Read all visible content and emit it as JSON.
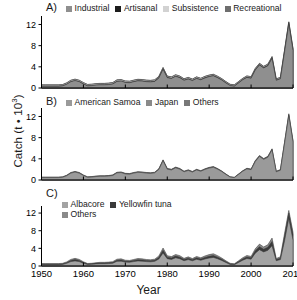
{
  "figure": {
    "xlabel": "Year",
    "ylabel_text": "Catch (t • 10",
    "ylabel_exp": "3",
    "ylabel_close": ")",
    "background": "#ffffff",
    "axis_color": "#000000"
  },
  "axes": {
    "xticks": [
      1950,
      1960,
      1970,
      1980,
      1990,
      2000,
      2010
    ],
    "yticks": [
      0,
      4,
      8,
      12
    ],
    "xlim": [
      1950,
      2010
    ],
    "ylim": [
      0,
      13.6
    ]
  },
  "panels": [
    {
      "tag": "A)",
      "legend_rows": [
        [
          "Industrial",
          "Artisanal",
          "Subsistence",
          "Recreational"
        ]
      ]
    },
    {
      "tag": "B)",
      "legend_rows": [
        [
          "American Samoa",
          "Japan",
          "Others"
        ]
      ]
    },
    {
      "tag": "C)",
      "legend_rows": [
        [
          "Albacore",
          "Yellowfin tuna"
        ],
        [
          "Others"
        ]
      ]
    }
  ],
  "colors": {
    "Industrial": "#8f8f8f",
    "Artisanal": "#1c1c1c",
    "Subsistence": "#d2d2d2",
    "Recreational": "#6e6e6e",
    "American Samoa": "#9a9a9a",
    "Japan": "#8a8a8a",
    "Others": "#787878",
    "Albacore": "#a3a3a3",
    "Yellowfin tuna": "#3a3a3a",
    "Others_C": "#8a8a8a"
  },
  "chart_data": [
    {
      "type": "area",
      "panel": "A",
      "title": "A) Catch by sector",
      "xlabel": "Year",
      "ylabel": "Catch (t • 10^3)",
      "xlim": [
        1950,
        2010
      ],
      "ylim": [
        0,
        13.6
      ],
      "grid": false,
      "legend_position": "top",
      "stacked": true,
      "x": [
        1950,
        1951,
        1952,
        1953,
        1954,
        1955,
        1956,
        1957,
        1958,
        1959,
        1960,
        1961,
        1962,
        1963,
        1964,
        1965,
        1966,
        1967,
        1968,
        1969,
        1970,
        1971,
        1972,
        1973,
        1974,
        1975,
        1976,
        1977,
        1978,
        1979,
        1980,
        1981,
        1982,
        1983,
        1984,
        1985,
        1986,
        1987,
        1988,
        1989,
        1990,
        1991,
        1992,
        1993,
        1994,
        1995,
        1996,
        1997,
        1998,
        1999,
        2000,
        2001,
        2002,
        2003,
        2004,
        2005,
        2006,
        2007,
        2008,
        2009,
        2010
      ],
      "series": [
        {
          "name": "Industrial",
          "values": [
            0.35,
            0.35,
            0.35,
            0.35,
            0.35,
            0.4,
            0.7,
            1.2,
            1.4,
            1.2,
            0.75,
            0.4,
            0.45,
            0.55,
            0.6,
            0.6,
            0.65,
            0.75,
            1.25,
            1.3,
            1.05,
            1.0,
            1.2,
            1.35,
            1.3,
            1.2,
            1.15,
            1.25,
            1.9,
            3.55,
            1.95,
            1.8,
            2.2,
            1.95,
            1.45,
            1.7,
            1.4,
            1.8,
            1.55,
            1.9,
            2.15,
            2.3,
            1.95,
            1.5,
            0.95,
            0.45,
            0.35,
            0.95,
            1.55,
            2.0,
            1.85,
            3.4,
            4.35,
            3.8,
            4.2,
            5.6,
            1.45,
            1.75,
            6.9,
            12.1,
            7.1
          ]
        },
        {
          "name": "Artisanal",
          "values": [
            0.02,
            0.02,
            0.02,
            0.02,
            0.02,
            0.02,
            0.03,
            0.03,
            0.03,
            0.03,
            0.03,
            0.03,
            0.03,
            0.03,
            0.03,
            0.03,
            0.03,
            0.04,
            0.04,
            0.04,
            0.04,
            0.04,
            0.04,
            0.05,
            0.05,
            0.05,
            0.05,
            0.05,
            0.06,
            0.08,
            0.06,
            0.06,
            0.07,
            0.06,
            0.05,
            0.06,
            0.05,
            0.06,
            0.05,
            0.06,
            0.07,
            0.07,
            0.06,
            0.05,
            0.04,
            0.03,
            0.03,
            0.04,
            0.05,
            0.06,
            0.06,
            0.08,
            0.09,
            0.08,
            0.09,
            0.11,
            0.05,
            0.06,
            0.12,
            0.18,
            0.13
          ]
        },
        {
          "name": "Subsistence",
          "values": [
            0.2,
            0.2,
            0.2,
            0.2,
            0.2,
            0.2,
            0.22,
            0.22,
            0.22,
            0.22,
            0.22,
            0.22,
            0.22,
            0.22,
            0.22,
            0.22,
            0.22,
            0.22,
            0.22,
            0.22,
            0.22,
            0.22,
            0.22,
            0.22,
            0.22,
            0.22,
            0.22,
            0.22,
            0.22,
            0.22,
            0.22,
            0.22,
            0.22,
            0.22,
            0.22,
            0.22,
            0.22,
            0.22,
            0.22,
            0.22,
            0.2,
            0.2,
            0.2,
            0.2,
            0.2,
            0.2,
            0.2,
            0.2,
            0.2,
            0.2,
            0.2,
            0.2,
            0.2,
            0.2,
            0.2,
            0.2,
            0.2,
            0.2,
            0.2,
            0.2,
            0.2
          ]
        },
        {
          "name": "Recreational",
          "values": [
            0.03,
            0.03,
            0.03,
            0.03,
            0.03,
            0.03,
            0.03,
            0.03,
            0.03,
            0.03,
            0.03,
            0.03,
            0.03,
            0.03,
            0.03,
            0.03,
            0.03,
            0.03,
            0.03,
            0.03,
            0.03,
            0.03,
            0.03,
            0.03,
            0.03,
            0.03,
            0.03,
            0.03,
            0.03,
            0.03,
            0.03,
            0.03,
            0.03,
            0.03,
            0.03,
            0.03,
            0.03,
            0.03,
            0.03,
            0.03,
            0.03,
            0.03,
            0.03,
            0.03,
            0.03,
            0.03,
            0.03,
            0.03,
            0.03,
            0.03,
            0.03,
            0.03,
            0.03,
            0.03,
            0.03,
            0.03,
            0.03,
            0.03,
            0.03,
            0.03,
            0.03
          ]
        }
      ]
    },
    {
      "type": "area",
      "panel": "B",
      "title": "B) Catch by fishing country",
      "xlabel": "Year",
      "ylabel": "Catch (t • 10^3)",
      "xlim": [
        1950,
        2010
      ],
      "ylim": [
        0,
        13.6
      ],
      "grid": false,
      "legend_position": "top",
      "stacked": true,
      "x": [
        1950,
        1951,
        1952,
        1953,
        1954,
        1955,
        1956,
        1957,
        1958,
        1959,
        1960,
        1961,
        1962,
        1963,
        1964,
        1965,
        1966,
        1967,
        1968,
        1969,
        1970,
        1971,
        1972,
        1973,
        1974,
        1975,
        1976,
        1977,
        1978,
        1979,
        1980,
        1981,
        1982,
        1983,
        1984,
        1985,
        1986,
        1987,
        1988,
        1989,
        1990,
        1991,
        1992,
        1993,
        1994,
        1995,
        1996,
        1997,
        1998,
        1999,
        2000,
        2001,
        2002,
        2003,
        2004,
        2005,
        2006,
        2007,
        2008,
        2009,
        2010
      ],
      "series": [
        {
          "name": "American Samoa",
          "values": [
            0.45,
            0.45,
            0.45,
            0.45,
            0.45,
            0.5,
            0.8,
            1.3,
            1.5,
            1.3,
            0.85,
            0.5,
            0.55,
            0.65,
            0.7,
            0.7,
            0.75,
            0.85,
            1.35,
            1.4,
            1.15,
            1.1,
            1.3,
            1.45,
            1.4,
            1.3,
            1.25,
            1.35,
            2.0,
            3.65,
            2.05,
            1.9,
            2.3,
            2.05,
            1.55,
            1.8,
            1.5,
            1.9,
            1.65,
            2.0,
            2.25,
            2.4,
            2.05,
            1.6,
            1.05,
            0.55,
            0.45,
            1.05,
            1.65,
            2.1,
            1.95,
            3.5,
            4.45,
            3.9,
            4.3,
            5.7,
            1.55,
            1.85,
            7.0,
            12.2,
            7.2
          ]
        },
        {
          "name": "Japan",
          "values": [
            0.05,
            0.05,
            0.05,
            0.05,
            0.05,
            0.05,
            0.05,
            0.06,
            0.06,
            0.06,
            0.05,
            0.05,
            0.05,
            0.05,
            0.05,
            0.05,
            0.05,
            0.06,
            0.06,
            0.06,
            0.06,
            0.06,
            0.06,
            0.06,
            0.06,
            0.06,
            0.06,
            0.06,
            0.07,
            0.08,
            0.07,
            0.07,
            0.07,
            0.07,
            0.06,
            0.06,
            0.06,
            0.06,
            0.06,
            0.06,
            0.07,
            0.07,
            0.06,
            0.05,
            0.04,
            0.03,
            0.03,
            0.04,
            0.05,
            0.06,
            0.06,
            0.08,
            0.09,
            0.08,
            0.09,
            0.1,
            0.05,
            0.06,
            0.11,
            0.16,
            0.12
          ]
        },
        {
          "name": "Others",
          "values": [
            0.05,
            0.05,
            0.05,
            0.05,
            0.05,
            0.05,
            0.05,
            0.06,
            0.06,
            0.06,
            0.05,
            0.05,
            0.05,
            0.05,
            0.05,
            0.05,
            0.05,
            0.06,
            0.06,
            0.06,
            0.06,
            0.06,
            0.06,
            0.06,
            0.06,
            0.06,
            0.06,
            0.06,
            0.07,
            0.08,
            0.07,
            0.07,
            0.07,
            0.07,
            0.06,
            0.06,
            0.06,
            0.06,
            0.06,
            0.06,
            0.07,
            0.07,
            0.06,
            0.05,
            0.04,
            0.03,
            0.03,
            0.04,
            0.05,
            0.06,
            0.06,
            0.08,
            0.09,
            0.08,
            0.09,
            0.1,
            0.05,
            0.06,
            0.11,
            0.16,
            0.12
          ]
        }
      ]
    },
    {
      "type": "area",
      "panel": "C",
      "title": "C) Catch by taxon",
      "xlabel": "Year",
      "ylabel": "Catch (t • 10^3)",
      "xlim": [
        1950,
        2010
      ],
      "ylim": [
        0,
        13.6
      ],
      "grid": false,
      "legend_position": "top",
      "stacked": true,
      "x": [
        1950,
        1951,
        1952,
        1953,
        1954,
        1955,
        1956,
        1957,
        1958,
        1959,
        1960,
        1961,
        1962,
        1963,
        1964,
        1965,
        1966,
        1967,
        1968,
        1969,
        1970,
        1971,
        1972,
        1973,
        1974,
        1975,
        1976,
        1977,
        1978,
        1979,
        1980,
        1981,
        1982,
        1983,
        1984,
        1985,
        1986,
        1987,
        1988,
        1989,
        1990,
        1991,
        1992,
        1993,
        1994,
        1995,
        1996,
        1997,
        1998,
        1999,
        2000,
        2001,
        2002,
        2003,
        2004,
        2005,
        2006,
        2007,
        2008,
        2009,
        2010
      ],
      "series": [
        {
          "name": "Albacore",
          "values": [
            0.3,
            0.3,
            0.3,
            0.3,
            0.3,
            0.35,
            0.6,
            1.0,
            1.15,
            1.0,
            0.6,
            0.35,
            0.38,
            0.48,
            0.52,
            0.52,
            0.55,
            0.62,
            1.05,
            1.1,
            0.88,
            0.85,
            1.0,
            1.15,
            1.1,
            1.0,
            0.95,
            1.05,
            1.6,
            2.95,
            1.65,
            1.5,
            1.85,
            1.65,
            1.2,
            1.45,
            1.18,
            1.52,
            1.3,
            1.6,
            1.8,
            1.95,
            1.65,
            1.25,
            0.8,
            0.35,
            0.28,
            0.8,
            1.3,
            1.7,
            1.55,
            2.9,
            3.7,
            3.2,
            3.55,
            4.6,
            1.2,
            1.45,
            5.8,
            10.8,
            5.9
          ]
        },
        {
          "name": "Yellowfin tuna",
          "values": [
            0.1,
            0.1,
            0.1,
            0.1,
            0.1,
            0.1,
            0.15,
            0.25,
            0.3,
            0.25,
            0.18,
            0.1,
            0.11,
            0.13,
            0.15,
            0.15,
            0.16,
            0.18,
            0.25,
            0.26,
            0.21,
            0.2,
            0.24,
            0.28,
            0.26,
            0.24,
            0.23,
            0.25,
            0.35,
            0.6,
            0.36,
            0.33,
            0.4,
            0.36,
            0.27,
            0.32,
            0.26,
            0.33,
            0.29,
            0.35,
            0.4,
            0.42,
            0.36,
            0.28,
            0.18,
            0.12,
            0.1,
            0.18,
            0.28,
            0.35,
            0.32,
            0.55,
            0.68,
            0.6,
            0.68,
            0.95,
            0.25,
            0.32,
            1.05,
            1.2,
            1.15
          ]
        },
        {
          "name": "Others",
          "values": [
            0.15,
            0.15,
            0.15,
            0.15,
            0.15,
            0.15,
            0.18,
            0.25,
            0.28,
            0.25,
            0.17,
            0.12,
            0.13,
            0.14,
            0.16,
            0.16,
            0.17,
            0.19,
            0.25,
            0.26,
            0.22,
            0.21,
            0.24,
            0.27,
            0.26,
            0.24,
            0.23,
            0.25,
            0.32,
            0.52,
            0.33,
            0.3,
            0.36,
            0.33,
            0.26,
            0.3,
            0.25,
            0.31,
            0.28,
            0.33,
            0.38,
            0.4,
            0.34,
            0.27,
            0.19,
            0.14,
            0.12,
            0.19,
            0.28,
            0.33,
            0.3,
            0.45,
            0.58,
            0.52,
            0.58,
            0.78,
            0.25,
            0.32,
            0.6,
            0.6,
            0.6
          ]
        }
      ]
    }
  ]
}
